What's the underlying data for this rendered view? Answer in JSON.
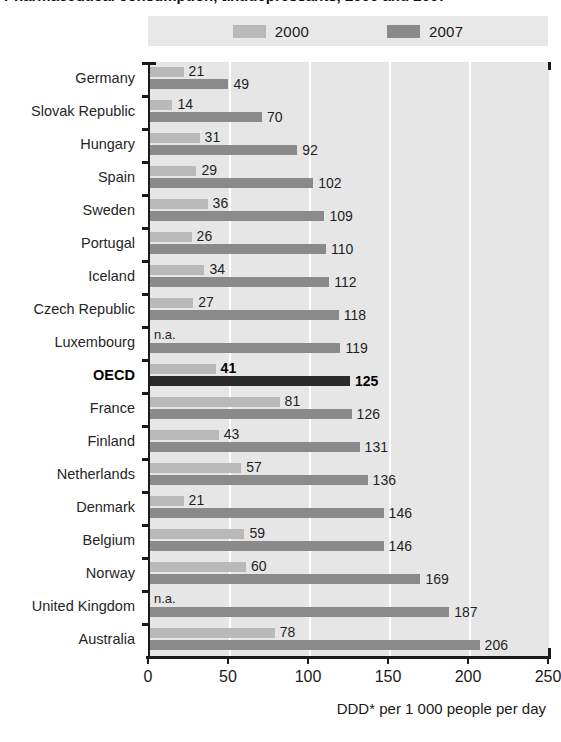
{
  "title": "Pharmaceutical consumption, antidepressants, 2000 and 2007",
  "legend": {
    "items": [
      {
        "label": "2000",
        "color": "#b9b9b9",
        "name": "legend-swatch-2000"
      },
      {
        "label": "2007",
        "color": "#8a8a8a",
        "name": "legend-swatch-2007"
      }
    ]
  },
  "axis": {
    "x_title": "DDD* per 1 000 people per day",
    "x_ticks": [
      "0",
      "50",
      "100",
      "150",
      "200",
      "250"
    ]
  },
  "colors": {
    "series_2000": "#b9b9b9",
    "series_2007": "#8a8a8a",
    "highlight_2000": "#b9b9b9",
    "highlight_2007": "#2a2a2a",
    "plot_background": "#e6e6e6",
    "gridline": "#ffffff",
    "axis": "#1a1a1a",
    "legend_background": "#e8e8e8"
  },
  "na_text": "n.a.",
  "chart_data": {
    "type": "bar",
    "orientation": "horizontal",
    "title": "Pharmaceutical consumption, antidepressants, 2000 and 2007",
    "xlabel": "DDD* per 1 000 people per day",
    "ylabel": "",
    "xlim": [
      0,
      250
    ],
    "xticks": [
      0,
      50,
      100,
      150,
      200,
      250
    ],
    "grid": true,
    "legend_position": "top",
    "categories": [
      "Germany",
      "Slovak Republic",
      "Hungary",
      "Spain",
      "Sweden",
      "Portugal",
      "Iceland",
      "Czech Republic",
      "Luxembourg",
      "OECD",
      "France",
      "Finland",
      "Netherlands",
      "Denmark",
      "Belgium",
      "Norway",
      "United Kingdom",
      "Australia"
    ],
    "series": [
      {
        "name": "2000",
        "values": [
          21,
          14,
          31,
          29,
          36,
          26,
          34,
          27,
          null,
          41,
          81,
          43,
          57,
          21,
          59,
          60,
          null,
          78
        ],
        "labels": [
          "21",
          "14",
          "31",
          "29",
          "36",
          "26",
          "34",
          "27",
          "n.a.",
          "41",
          "81",
          "43",
          "57",
          "21",
          "59",
          "60",
          "n.a.",
          "78"
        ]
      },
      {
        "name": "2007",
        "values": [
          49,
          70,
          92,
          102,
          109,
          110,
          112,
          118,
          119,
          125,
          126,
          131,
          136,
          146,
          146,
          169,
          187,
          206
        ],
        "labels": [
          "49",
          "70",
          "92",
          "102",
          "109",
          "110",
          "112",
          "118",
          "119",
          "125",
          "126",
          "131",
          "136",
          "146",
          "146",
          "169",
          "187",
          "206"
        ]
      }
    ],
    "highlight_category": "OECD"
  }
}
